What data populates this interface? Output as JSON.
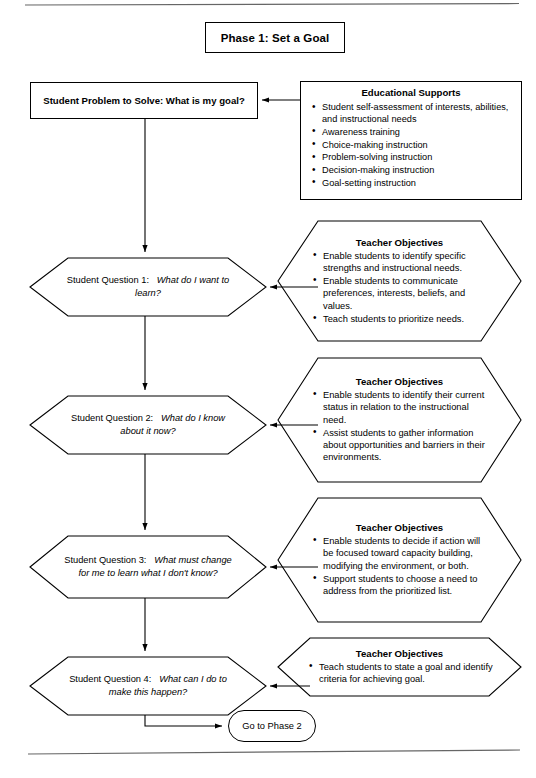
{
  "page": {
    "phase_title": "Phase 1:  Set a Goal",
    "top_rule": "horizontal-rule",
    "bottom_rule": "horizontal-rule"
  },
  "problem": {
    "text": "Student Problem to Solve:  What is my goal?"
  },
  "educational_supports": {
    "title": "Educational Supports",
    "bullets": [
      "Student self-assessment of interests, abilities, and instructional needs",
      "Awareness training",
      "Choice-making instruction",
      "Problem-solving instruction",
      "Decision-making instruction",
      "Goal-setting instruction"
    ]
  },
  "questions": [
    {
      "label": "Student Question 1:",
      "text": "What do I want to learn?"
    },
    {
      "label": "Student Question 2:",
      "text": "What do I know about it now?"
    },
    {
      "label": "Student Question 3:",
      "text": "What must change for me to learn what I don't know?"
    },
    {
      "label": "Student Question 4:",
      "text": "What can I do to make this happen?"
    }
  ],
  "objectives": [
    {
      "title": "Teacher Objectives",
      "bullets": [
        "Enable students to identify specific strengths and instructional needs.",
        "Enable students to communicate preferences, interests, beliefs, and values.",
        "Teach students to prioritize needs."
      ]
    },
    {
      "title": "Teacher Objectives",
      "bullets": [
        "Enable students to identify their current status in relation to the instructional need.",
        "Assist students to gather information about opportunities and barriers in their environments."
      ]
    },
    {
      "title": "Teacher Objectives",
      "bullets": [
        "Enable students to decide if action will be focused toward capacity building, modifying the environment, or both.",
        "Support students to choose a need to address from the prioritized list."
      ]
    },
    {
      "title": "Teacher Objectives",
      "bullets": [
        "Teach students to state a goal and identify criteria for achieving goal."
      ]
    }
  ],
  "terminator": {
    "label": "Go to Phase 2"
  },
  "colors": {
    "line": "#000000",
    "background": "#ffffff",
    "rule": "#555555"
  }
}
